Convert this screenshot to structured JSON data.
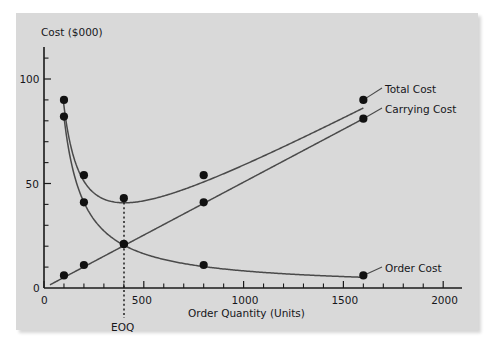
{
  "chart_data": {
    "type": "line",
    "title": "",
    "xlabel": "Order Quantity (Units)",
    "ylabel": "Cost ($000)",
    "xlim": [
      0,
      2100
    ],
    "ylim": [
      0,
      118
    ],
    "xticks": [
      0,
      500,
      1000,
      1500,
      2000
    ],
    "xtick_labels": [
      "0",
      "500",
      "1000",
      "1500",
      "2000"
    ],
    "x_minor_step": 100,
    "yticks": [
      50,
      100
    ],
    "ytick_labels": [
      "50",
      "100"
    ],
    "y_minor_step": 10,
    "grid": false,
    "legend_position": "right-inline-labels",
    "annotations": [
      {
        "text": "EOQ",
        "x": 400,
        "y": 0,
        "note": "dotted vertical line at economic order quantity"
      }
    ],
    "series": [
      {
        "name": "Total Cost",
        "label": "Total Cost",
        "points": [
          {
            "x": 100,
            "y": 90
          },
          {
            "x": 200,
            "y": 54
          },
          {
            "x": 400,
            "y": 43
          },
          {
            "x": 800,
            "y": 54
          },
          {
            "x": 1600,
            "y": 90
          }
        ]
      },
      {
        "name": "Carrying Cost",
        "label": "Carrying Cost",
        "points": [
          {
            "x": 100,
            "y": 6
          },
          {
            "x": 200,
            "y": 11
          },
          {
            "x": 400,
            "y": 21
          },
          {
            "x": 800,
            "y": 41
          },
          {
            "x": 1600,
            "y": 81
          }
        ]
      },
      {
        "name": "Order Cost",
        "label": "Order Cost",
        "points": [
          {
            "x": 100,
            "y": 82
          },
          {
            "x": 200,
            "y": 41
          },
          {
            "x": 400,
            "y": 21
          },
          {
            "x": 800,
            "y": 11
          },
          {
            "x": 1600,
            "y": 6
          }
        ]
      }
    ]
  },
  "colors": {
    "panel": "#d9d9d9",
    "axis": "#1a1a1a",
    "curve": "#4a4a4a",
    "marker": "#111111",
    "text": "#16161a"
  }
}
